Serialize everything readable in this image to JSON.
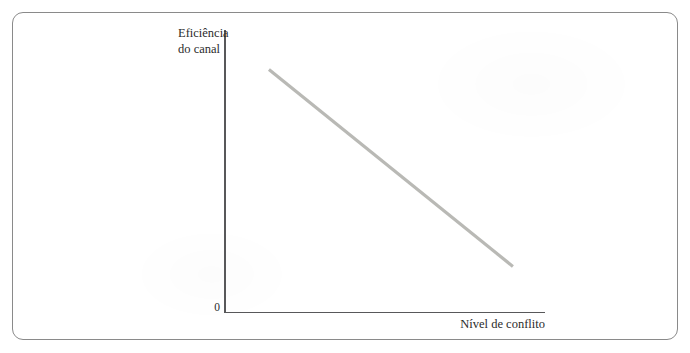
{
  "figure": {
    "background_color": "#ffffff",
    "frame_color": "#8a8a8a",
    "axis_color": "#58585a",
    "line_color": "#b9b9b5",
    "text_color": "#2b2b2b"
  },
  "chart_data": {
    "type": "line",
    "title": "",
    "subtitle": "",
    "xlabel": "Nível de conflito",
    "ylabel": "Eficiência do canal",
    "origin_label": "0",
    "grid": false,
    "legend": null,
    "xlim": [
      0,
      100
    ],
    "ylim": [
      0,
      100
    ],
    "xticks": [],
    "yticks": [],
    "annotations": [],
    "series": [
      {
        "name": "Eficiência do canal vs. nível de conflito",
        "color": "#b9b9b5",
        "linewidth": 3.2,
        "x": [
          14,
          90
        ],
        "y": [
          86,
          16
        ],
        "description": "Reta descendente: a eficiência do canal diminui à medida que o nível de conflito aumenta"
      }
    ]
  },
  "labels": {
    "y_axis_line1": "Eficiência",
    "y_axis_line2": "do canal",
    "y_axis_full": "Eficiência\ndo canal",
    "x_axis": "Nível de conflito",
    "origin": "0"
  }
}
